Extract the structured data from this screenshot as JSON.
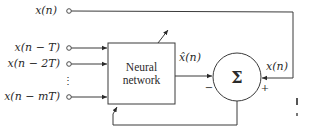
{
  "diagram": {
    "inputs": [
      {
        "label": "x(n)"
      },
      {
        "label": "x(n − T)"
      },
      {
        "label": "x(n − 2T)"
      },
      {
        "label": "⋮"
      },
      {
        "label": "x(n − mT)"
      }
    ],
    "block": {
      "line1": "Neural",
      "line2": "network"
    },
    "predicted_label": "x̂(n)",
    "target_label": "x(n)",
    "summer": {
      "symbol": "Σ",
      "minus": "−",
      "plus": "+"
    },
    "colors": {
      "stroke": "#3a3a3a",
      "text": "#2a2a2a",
      "background": "#ffffff"
    }
  }
}
